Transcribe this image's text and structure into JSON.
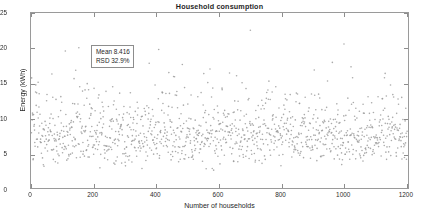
{
  "chart_data": {
    "type": "scatter",
    "title": "Household consumption",
    "xlabel": "Number of households",
    "ylabel": "Energy (kWh)",
    "xlim": [
      0,
      1210
    ],
    "ylim": [
      0,
      25
    ],
    "xticks": [
      0,
      200,
      400,
      600,
      800,
      1000,
      1200
    ],
    "yticks": [
      0,
      5,
      10,
      15,
      20,
      25
    ],
    "xtick_labels": [
      "0",
      "200",
      "400",
      "600",
      "800",
      "1000",
      "1200"
    ],
    "ytick_labels": [
      "0",
      "5",
      "10",
      "15",
      "20",
      "25"
    ],
    "grid": false,
    "legend": false,
    "n_points": 1200,
    "marker": {
      "shape": "dot",
      "size_px": 1.6,
      "color": "#9b9b9b",
      "opacity": 0.85
    },
    "distribution": {
      "mean": 8.416,
      "rsd_percent": 32.9,
      "std": 2.769,
      "min_observed": 2.2,
      "max_observed": 19.0,
      "shape": "right-skewed lognormal-like cloud, dense band between 4 and 13 kWh"
    },
    "annotations": [
      {
        "name": "stats-box",
        "x_data": 100,
        "y_data": 21.5,
        "lines": [
          "Mean 8.416",
          "RSD 32.9%"
        ],
        "boxed": true
      }
    ],
    "series": [
      {
        "name": "household energy consumption",
        "x": "1 .. 1200 (household index, one point per household)",
        "y": "per-household daily energy in kWh; see distribution"
      }
    ]
  },
  "chart": {
    "title": "Household consumption",
    "x_axis": {
      "label": "Number of households",
      "ticks": [
        "0",
        "200",
        "400",
        "600",
        "800",
        "1000",
        "1200"
      ]
    },
    "y_axis": {
      "label": "Energy (kWh)",
      "ticks": [
        "0",
        "5",
        "10",
        "15",
        "20",
        "25"
      ]
    },
    "stats": {
      "mean_line": "Mean 8.416",
      "rsd_line": "RSD 32.9%"
    },
    "colors": {
      "marker": "#9b9b9b",
      "axis": "#9a9a9a",
      "text": "#1f1f1f",
      "background": "#ffffff"
    }
  }
}
